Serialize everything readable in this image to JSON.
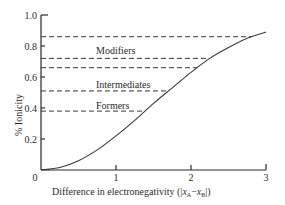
{
  "chart_data": {
    "type": "line",
    "title": "",
    "xlabel": "Difference in electronegativity (|x_A − x_B|)",
    "ylabel": "% Ionicity",
    "xlim": [
      0,
      3
    ],
    "ylim": [
      0,
      1.0
    ],
    "grid": false,
    "legend": "none",
    "x_ticks": [
      "0",
      "1",
      "2",
      "3"
    ],
    "y_ticks": [
      "0",
      "0.2",
      "0.4",
      "0.6",
      "0.8",
      "1.0"
    ],
    "series": [
      {
        "name": "Ionicity curve",
        "x": [
          0,
          0.25,
          0.5,
          0.75,
          1.0,
          1.25,
          1.5,
          1.75,
          2.0,
          2.25,
          2.5,
          2.75,
          3.0
        ],
        "values": [
          0,
          0.016,
          0.06,
          0.13,
          0.22,
          0.32,
          0.43,
          0.53,
          0.63,
          0.72,
          0.79,
          0.85,
          0.89
        ]
      }
    ],
    "reference_lines": [
      {
        "y": 0.86,
        "style": "dashed"
      },
      {
        "y": 0.72,
        "style": "dashed"
      },
      {
        "y": 0.66,
        "style": "dashed"
      },
      {
        "y": 0.51,
        "style": "dashed"
      },
      {
        "y": 0.38,
        "style": "dashed"
      }
    ],
    "annotations": [
      {
        "text": "Modifiers",
        "y": 0.79
      },
      {
        "text": "Intermediates",
        "y": 0.58
      },
      {
        "text": "Formers",
        "y": 0.44
      }
    ]
  },
  "labels": {
    "xlabel_prefix": "Difference in electronegativity (|",
    "xlabel_xa": "x",
    "xlabel_a": "A",
    "xlabel_minus": "−",
    "xlabel_xb": "x",
    "xlabel_b": "B",
    "xlabel_suffix": "|)",
    "ylabel": "% Ionicity",
    "x_tick_0": "0",
    "x_tick_1": "1",
    "x_tick_2": "2",
    "x_tick_3": "3",
    "y_tick_02": "0.2",
    "y_tick_04": "0.4",
    "y_tick_06": "0.6",
    "y_tick_08": "0.8",
    "y_tick_10": "1.0",
    "modifiers": "Modifiers",
    "intermediates": "Intermediates",
    "formers": "Formers"
  },
  "colors": {
    "axis": "#2a2a2a",
    "curve": "#3a3a3a",
    "dashed": "#3a3a3a"
  }
}
